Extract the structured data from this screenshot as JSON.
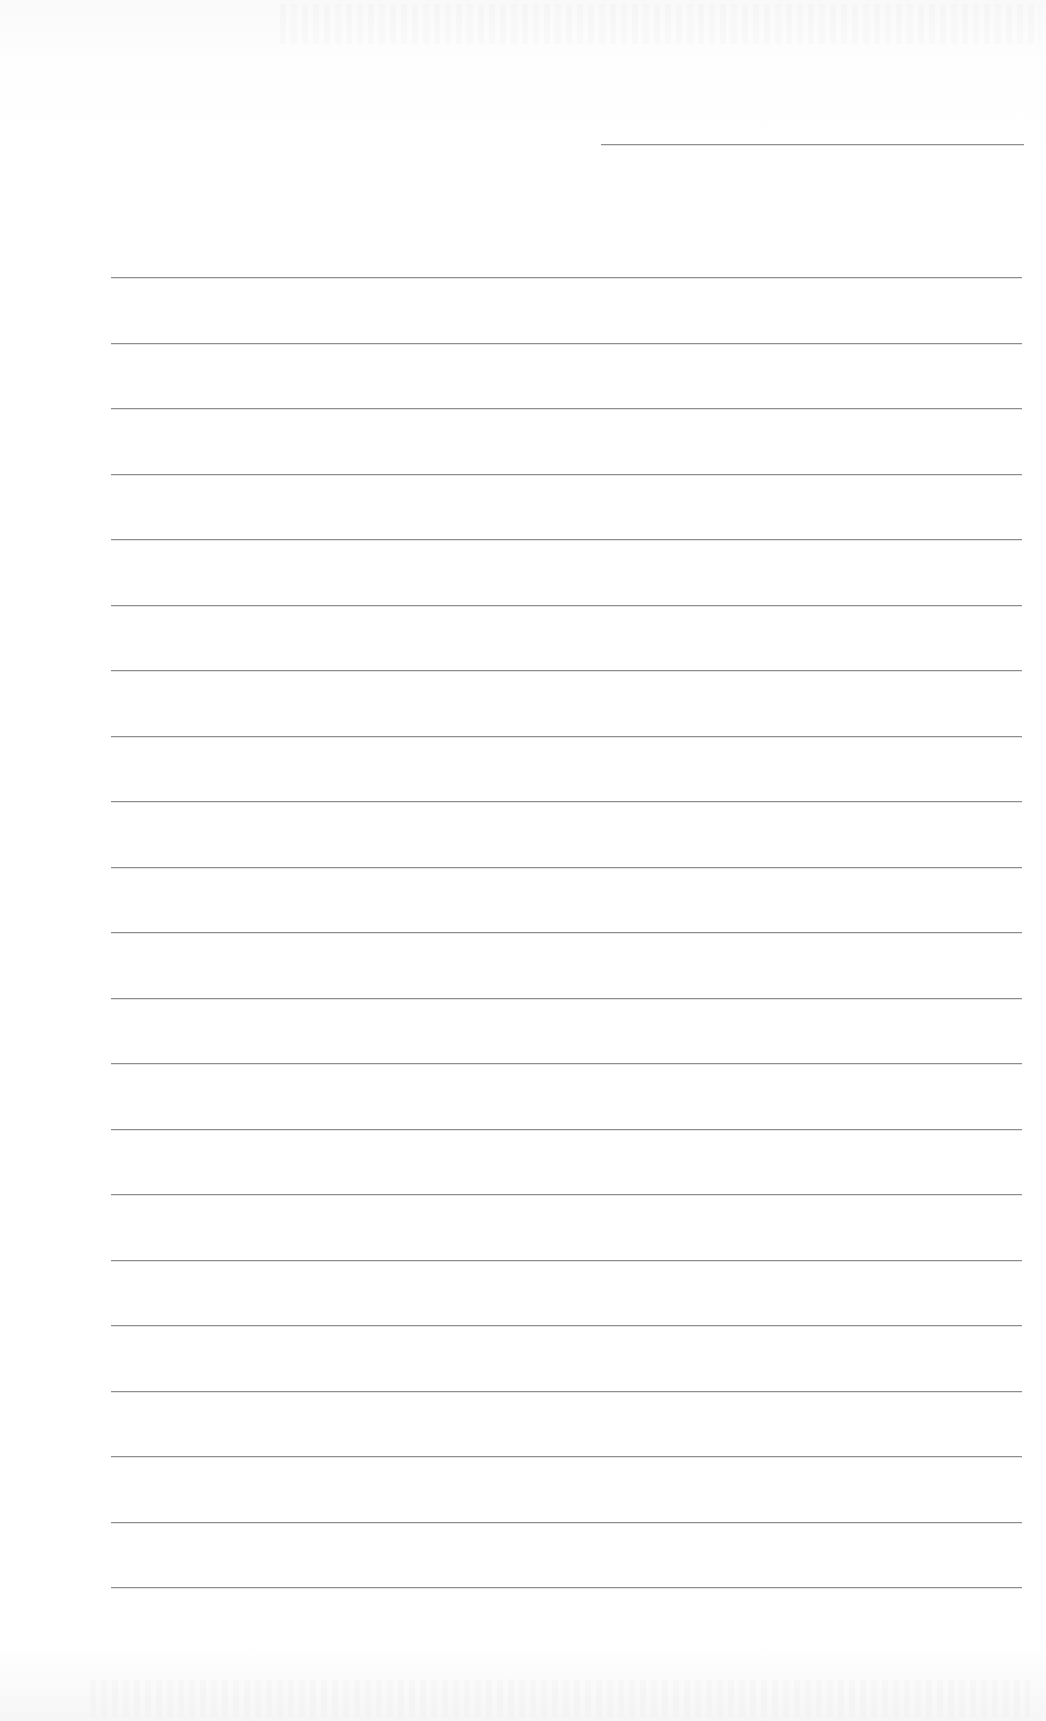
{
  "page": {
    "type": "blank lined notebook page",
    "background_color": "#ffffff",
    "rule_color": "#8e8e8e",
    "header_line": {
      "x_start": 601,
      "x_end": 1024,
      "y": 144
    },
    "ruled_lines": {
      "count": 21,
      "x_start": 111,
      "x_end": 1022,
      "y_first": 277,
      "spacing": 65.5
    },
    "text_content": ""
  }
}
